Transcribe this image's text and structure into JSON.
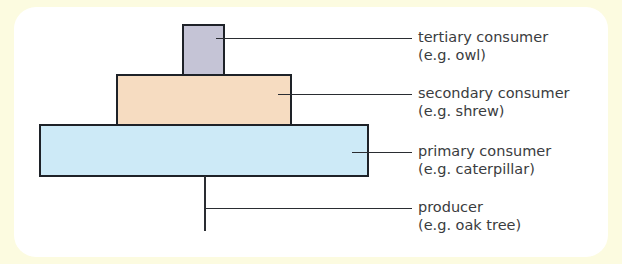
{
  "diagram": {
    "levels": [
      {
        "name": "tertiary consumer",
        "example": "(e.g. owl)",
        "color": "#c5c4d6"
      },
      {
        "name": "secondary consumer",
        "example": "(e.g. shrew)",
        "color": "#f6dcc1"
      },
      {
        "name": "primary consumer",
        "example": "(e.g. caterpillar)",
        "color": "#cdeaf7"
      },
      {
        "name": "producer",
        "example": "(e.g. oak tree)",
        "color": "#ffffff"
      }
    ]
  }
}
